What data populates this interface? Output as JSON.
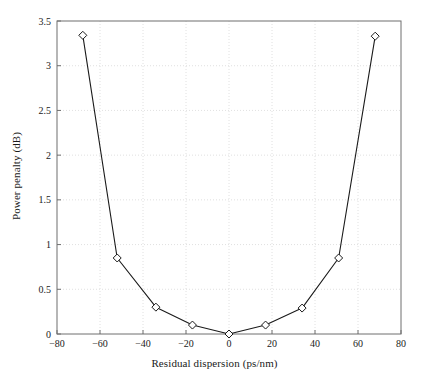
{
  "chart_data": {
    "type": "line",
    "title": "",
    "xlabel": "Residual dispersion (ps/nm)",
    "ylabel": "Power penalty (dB)",
    "xlim": [
      -80,
      80
    ],
    "ylim": [
      0,
      3.5
    ],
    "xticks": [
      -80,
      -60,
      -40,
      -20,
      0,
      20,
      40,
      60,
      80
    ],
    "xticklabels": [
      "−80",
      "−60",
      "−40",
      "−20",
      "0",
      "20",
      "40",
      "60",
      "80"
    ],
    "yticks": [
      0,
      0.5,
      1,
      1.5,
      2,
      2.5,
      3,
      3.5
    ],
    "yticklabels": [
      "0",
      "0.5",
      "1",
      "1.5",
      "2",
      "2.5",
      "3",
      "3.5"
    ],
    "grid": true,
    "grid_style": "dotted",
    "legend": null,
    "marker": "diamond-open",
    "line_color": "#1a1a1a",
    "marker_fill": "#ffffff",
    "marker_edge": "#1a1a1a",
    "grid_color": "#d8d8d8",
    "axis_color": "#6f6f6f",
    "x": [
      -68,
      -52,
      -34,
      -17,
      0,
      17,
      34,
      51,
      68
    ],
    "values": [
      3.34,
      0.85,
      0.3,
      0.1,
      0.0,
      0.1,
      0.29,
      0.85,
      3.33
    ],
    "series": [
      {
        "name": "Power penalty",
        "x": [
          -68,
          -52,
          -34,
          -17,
          0,
          17,
          34,
          51,
          68
        ],
        "values": [
          3.34,
          0.85,
          0.3,
          0.1,
          0.0,
          0.1,
          0.29,
          0.85,
          3.33
        ]
      }
    ]
  }
}
